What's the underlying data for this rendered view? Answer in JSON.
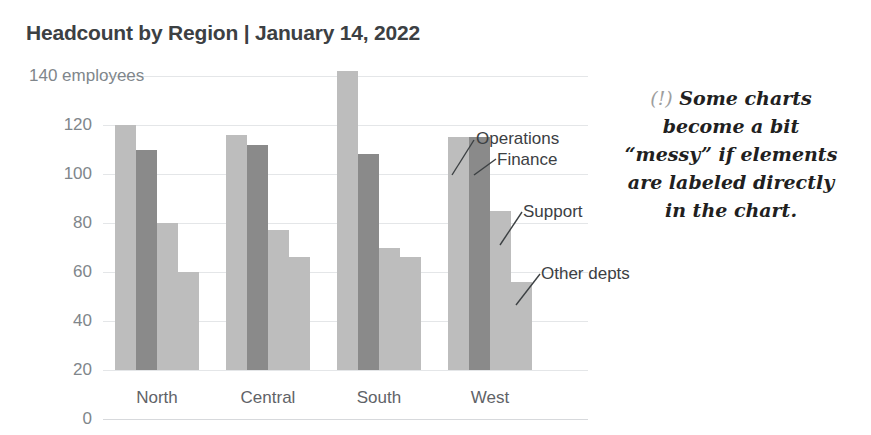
{
  "chart_data": {
    "type": "bar",
    "title": "Headcount by Region | January 14, 2022",
    "subtitle": "140 employees",
    "unit_label": "employees",
    "xlabel": "",
    "ylabel": "",
    "ylim": [
      0,
      140
    ],
    "ytick_values": [
      0,
      20,
      40,
      60,
      80,
      100,
      120,
      140
    ],
    "ytick_labels": [
      "0",
      "20",
      "40",
      "60",
      "80",
      "100",
      "120",
      "140 employees"
    ],
    "grid": true,
    "legend": "direct-labels-in-chart",
    "categories": [
      "North",
      "Central",
      "South",
      "West"
    ],
    "series": [
      {
        "name": "Operations",
        "color": "#bdbdbd",
        "values": [
          100,
          96,
          122,
          95
        ]
      },
      {
        "name": "Finance",
        "color": "#8a8a8a",
        "values": [
          90,
          92,
          88,
          95
        ]
      },
      {
        "name": "Support",
        "color": "#bdbdbd",
        "values": [
          60,
          57,
          50,
          65
        ]
      },
      {
        "name": "Other depts",
        "color": "#bdbdbd",
        "values": [
          40,
          46,
          46,
          36
        ]
      }
    ],
    "annotations": [
      {
        "name": "Operations",
        "text": "Operations"
      },
      {
        "name": "Finance",
        "text": "Finance"
      },
      {
        "name": "Support",
        "text": "Support"
      },
      {
        "name": "Other depts",
        "text": "Other depts"
      }
    ]
  },
  "side_note": {
    "marker": "(!)",
    "text": "Some charts become a bit “messy” if elements are labeled directly in the chart.",
    "line1": "Some charts",
    "line2": "become a bit",
    "line3": "“messy” if elements",
    "line4": "are labeled directly",
    "line5": "in the chart."
  },
  "colors": {
    "bar_light": "#bdbdbd",
    "bar_dark": "#8a8a8a",
    "title": "#3c4043",
    "tick": "#80868b",
    "gridline": "#e4e6e8",
    "note_text": "#221f1f",
    "note_marker": "#9e9e9e"
  }
}
